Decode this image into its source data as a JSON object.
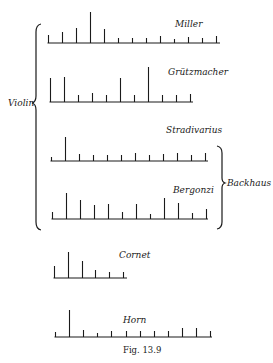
{
  "figure": {
    "caption": "Fig. 13.9",
    "group_labels": {
      "violin": "Violin",
      "backhaus": "Backhaus"
    },
    "ink_color": "#1a1a1a",
    "background": "#ffffff"
  },
  "chart_data": {
    "type": "bar",
    "title": "Fig. 13.9",
    "xlabel": "",
    "ylabel": "",
    "grid": false,
    "groups": [
      {
        "label": "Violin",
        "members": [
          "Miller",
          "Grützmacher",
          "Stradivarius",
          "Bergonzi"
        ]
      },
      {
        "label": "Backhaus",
        "members": [
          "Stradivarius",
          "Bergonzi"
        ]
      }
    ],
    "series": [
      {
        "name": "Miller",
        "baseline_y": 43,
        "x0": 48,
        "spacing": 14,
        "x_end": 220,
        "label_x": 175,
        "label_y": 27,
        "values": [
          8,
          11,
          15,
          31,
          14,
          5,
          5,
          5,
          7,
          4,
          6,
          5,
          7
        ]
      },
      {
        "name": "Grützmacher",
        "baseline_y": 102,
        "x0": 50,
        "spacing": 14,
        "x_end": 193,
        "label_x": 168,
        "label_y": 75,
        "values": [
          24,
          25,
          7,
          9,
          7,
          24,
          7,
          35,
          7,
          7,
          8
        ]
      },
      {
        "name": "Stradivarius",
        "baseline_y": 161,
        "x0": 51,
        "spacing": 14,
        "x_end": 208,
        "label_x": 166,
        "label_y": 133,
        "values": [
          4,
          24,
          7,
          6,
          6,
          6,
          8,
          6,
          7,
          8,
          6,
          8
        ]
      },
      {
        "name": "Bergonzi",
        "baseline_y": 219,
        "x0": 52,
        "spacing": 14,
        "x_end": 208,
        "label_x": 173,
        "label_y": 193,
        "values": [
          7,
          26,
          19,
          14,
          15,
          7,
          15,
          5,
          21,
          16,
          6,
          10
        ]
      },
      {
        "name": "Cornet",
        "baseline_y": 278,
        "x0": 54,
        "spacing": 13.8,
        "x_end": 127,
        "label_x": 119,
        "label_y": 258,
        "values": [
          12,
          26,
          17,
          8,
          6,
          6
        ]
      },
      {
        "name": "Horn",
        "baseline_y": 337,
        "x0": 55,
        "spacing": 14.1,
        "x_end": 212,
        "label_x": 123,
        "label_y": 323,
        "values": [
          5,
          27,
          7,
          4,
          6,
          6,
          6,
          6,
          6,
          9,
          9,
          6
        ]
      }
    ]
  }
}
